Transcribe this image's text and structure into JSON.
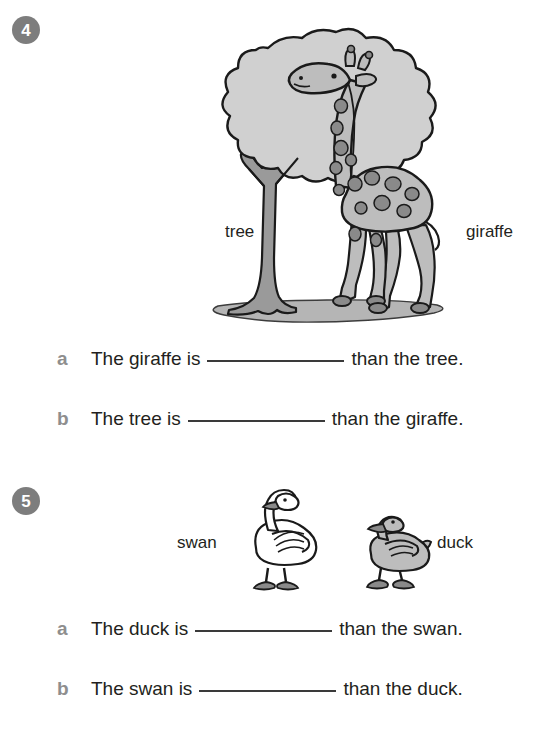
{
  "worksheet": {
    "questions": [
      {
        "number": "4",
        "illustration": {
          "name": "tree-and-giraffe-illustration",
          "items": [
            "tree",
            "giraffe"
          ]
        },
        "labels": [
          {
            "name": "tree-label",
            "text": "tree"
          },
          {
            "name": "giraffe-label",
            "text": "giraffe"
          }
        ],
        "rows": [
          {
            "marker": "a",
            "before": "The giraffe is",
            "after": "than the tree."
          },
          {
            "marker": "b",
            "before": "The tree is",
            "after": "than the giraffe."
          }
        ]
      },
      {
        "number": "5",
        "illustration": {
          "name": "swan-and-duck-illustration",
          "items": [
            "swan",
            "duck"
          ]
        },
        "labels": [
          {
            "name": "swan-label",
            "text": "swan"
          },
          {
            "name": "duck-label",
            "text": "duck"
          }
        ],
        "rows": [
          {
            "marker": "a",
            "before": "The duck is",
            "after": "than the swan."
          },
          {
            "marker": "b",
            "before": "The swan is",
            "after": "than the duck."
          }
        ]
      }
    ],
    "colors": {
      "badge_background": "#7d7d7d",
      "badge_text": "#ffffff",
      "marker_text": "#8e8e8e",
      "body_text": "#231f20",
      "blank_line": "#3a3a3a",
      "art_outline": "#1a1a1a",
      "canopy_fill": "#d0d0d0",
      "trunk_fill": "#9a9a9a",
      "giraffe_body": "#bdbdbd",
      "giraffe_spots": "#8a8a8a",
      "swan_body": "#ffffff",
      "duck_body": "#bdbdbd",
      "beak_feet": "#8a8a8a",
      "ground": "#b5b5b5"
    }
  }
}
